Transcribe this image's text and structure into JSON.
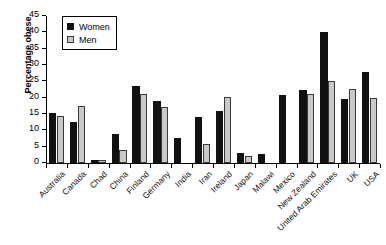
{
  "chart_data": {
    "type": "bar",
    "title": "",
    "xlabel": "",
    "ylabel": "Percentage obese",
    "ylim": [
      0,
      45
    ],
    "yticks": [
      0,
      5,
      10,
      15,
      20,
      25,
      30,
      35,
      40,
      45
    ],
    "grid": false,
    "legend_position": "top-left",
    "categories": [
      "Australia",
      "Canada",
      "Chad",
      "China",
      "Finland",
      "Germany",
      "India",
      "Iran",
      "Ireland",
      "Japan",
      "Malawi",
      "Mexico",
      "New Zealand",
      "United Arab Emirates",
      "UK",
      "USA"
    ],
    "series": [
      {
        "name": "Women",
        "color": "#111111",
        "values": [
          15.3,
          12.5,
          1.0,
          9.0,
          23.6,
          19.1,
          7.8,
          14.0,
          16.0,
          3.0,
          2.8,
          20.8,
          22.3,
          40.0,
          19.5,
          28.0
        ]
      },
      {
        "name": "Men",
        "color": "#c9c9c9",
        "values": [
          14.5,
          17.5,
          0.8,
          4.0,
          21.0,
          17.2,
          0,
          5.8,
          20.2,
          2.1,
          0,
          0,
          21.0,
          25.0,
          22.8,
          19.8
        ]
      }
    ]
  },
  "legend": {
    "items": [
      {
        "label": "Women"
      },
      {
        "label": "Men"
      }
    ]
  }
}
